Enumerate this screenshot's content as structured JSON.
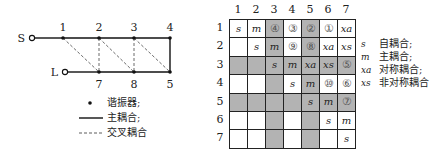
{
  "topology": {
    "source_label": "S",
    "load_label": "L",
    "top_nodes": [
      "1",
      "2",
      "3",
      "4"
    ],
    "bottom_nodes": [
      "7",
      "8",
      "5"
    ],
    "main_couplings": [
      [
        "S",
        "1"
      ],
      [
        "1",
        "2"
      ],
      [
        "2",
        "3"
      ],
      [
        "3",
        "4"
      ],
      [
        "4",
        "5"
      ],
      [
        "5",
        "8"
      ],
      [
        "8",
        "7"
      ],
      [
        "7",
        "L"
      ]
    ],
    "cross_couplings": [
      [
        "1",
        "7"
      ],
      [
        "2",
        "7"
      ],
      [
        "2",
        "8"
      ],
      [
        "3",
        "8"
      ],
      [
        "3",
        "5"
      ]
    ],
    "legend": [
      {
        "symbol": "dot",
        "label": "谐振器;"
      },
      {
        "symbol": "solid-line",
        "label": "主耦合;"
      },
      {
        "symbol": "dashed-line",
        "label": "交叉耦合"
      }
    ]
  },
  "matrix": {
    "col_headers": [
      "1",
      "2",
      "3",
      "4",
      "5",
      "6",
      "7"
    ],
    "row_headers": [
      "1",
      "2",
      "3",
      "4",
      "5",
      "6",
      "7"
    ],
    "rows": [
      [
        "s",
        "m",
        "④",
        "③",
        "②",
        "①",
        "xa"
      ],
      [
        "",
        "s",
        "m",
        "⑨",
        "⑧",
        "xa",
        "xs"
      ],
      [
        "",
        "",
        "s",
        "m",
        "xa",
        "xs",
        "⑤"
      ],
      [
        "",
        "",
        "",
        "s",
        "m",
        "⑩",
        "⑥"
      ],
      [
        "",
        "",
        "",
        "",
        "s",
        "m",
        "⑦"
      ],
      [
        "",
        "",
        "",
        "",
        "",
        "s",
        "m"
      ],
      [
        "",
        "",
        "",
        "",
        "",
        "",
        "s"
      ]
    ],
    "shaded": [
      [
        false,
        false,
        true,
        false,
        true,
        false,
        false
      ],
      [
        false,
        false,
        true,
        false,
        true,
        false,
        false
      ],
      [
        true,
        true,
        true,
        true,
        true,
        true,
        true
      ],
      [
        false,
        false,
        true,
        false,
        true,
        false,
        false
      ],
      [
        true,
        true,
        true,
        true,
        true,
        true,
        true
      ],
      [
        false,
        false,
        true,
        false,
        true,
        false,
        false
      ],
      [
        false,
        false,
        true,
        false,
        true,
        false,
        false
      ]
    ],
    "shade_color": "#b3b3b3"
  },
  "legend": [
    {
      "symbol": "s",
      "label": "自耦合;"
    },
    {
      "symbol": "m",
      "label": "主耦合;"
    },
    {
      "symbol": "xa",
      "label": "对称耦合;"
    },
    {
      "symbol": "xs",
      "label": "非对称耦合"
    }
  ]
}
